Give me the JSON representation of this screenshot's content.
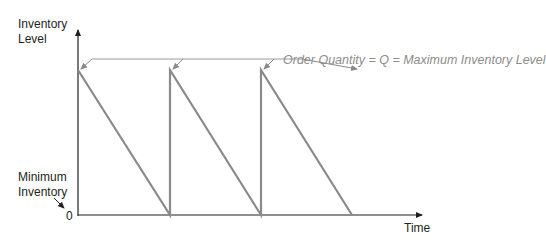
{
  "diagram": {
    "y_axis_label_line1": "Inventory",
    "y_axis_label_line2": "Level",
    "x_axis_label": "Time",
    "zero_label": "0",
    "min_inventory_line1": "Minimum",
    "min_inventory_line2": "Inventory",
    "annotation": "Order Quantity = Q = Maximum Inventory Level",
    "colors": {
      "axis": "#231f20",
      "sawtooth": "#8a8a8a",
      "annotation": "#8c8c8c"
    },
    "cycles": 3
  }
}
